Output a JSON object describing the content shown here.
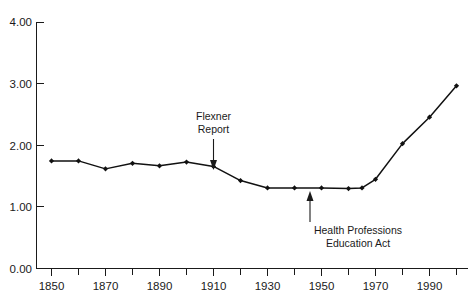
{
  "chart_data": {
    "type": "line",
    "title": "",
    "subtitle": "",
    "xlabel": "",
    "ylabel": "",
    "xlim": [
      1845,
      2005
    ],
    "ylim": [
      0.0,
      4.0
    ],
    "grid": false,
    "legend": "none",
    "x": [
      1850,
      1860,
      1870,
      1880,
      1890,
      1900,
      1910,
      1920,
      1930,
      1940,
      1950,
      1960,
      1965,
      1970,
      1980,
      1990,
      2000
    ],
    "values": [
      1.75,
      1.75,
      1.62,
      1.71,
      1.67,
      1.73,
      1.66,
      1.43,
      1.31,
      1.31,
      1.31,
      1.3,
      1.31,
      1.45,
      2.03,
      2.46,
      2.97
    ],
    "series": [
      {
        "name": "series-1",
        "values": [
          1.75,
          1.75,
          1.62,
          1.71,
          1.67,
          1.73,
          1.66,
          1.43,
          1.31,
          1.31,
          1.31,
          1.3,
          1.31,
          1.45,
          2.03,
          2.46,
          2.97
        ]
      }
    ],
    "yticks": [
      0.0,
      1.0,
      2.0,
      3.0,
      4.0
    ],
    "ytick_labels": [
      "0.00",
      "1.00",
      "2.00",
      "3.00",
      "4.00"
    ],
    "xticks_major": [
      1850,
      1870,
      1890,
      1910,
      1930,
      1950,
      1970,
      1990
    ],
    "xtick_labels": [
      "1850",
      "1870",
      "1890",
      "1910",
      "1930",
      "1950",
      "1970",
      "1990"
    ],
    "xticks_minor": [
      1860,
      1880,
      1900,
      1920,
      1940,
      1960,
      1980,
      2000
    ],
    "marker": "diamond",
    "line_color": "#111111",
    "marker_color": "#111111",
    "background_color": "#ffffff",
    "annotations": [
      {
        "id": "flexner",
        "lines": [
          "Flexner",
          "Report"
        ],
        "line1": "Flexner",
        "line2": "Report",
        "target_x": 1910,
        "target_y": 1.66,
        "direction": "down"
      },
      {
        "id": "hpea",
        "lines": [
          "Health Professions",
          "Education Act"
        ],
        "line1": "Health Professions",
        "line2": "Education Act",
        "target_x": 1965,
        "target_y": 1.31,
        "direction": "up"
      }
    ]
  }
}
